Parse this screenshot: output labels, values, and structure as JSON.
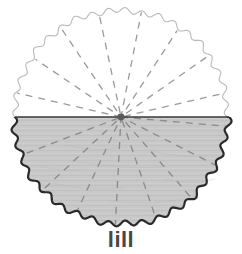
{
  "figure": {
    "name": "scalloped-circle-radial-diagram",
    "caption": "lill",
    "background_color": "#ffffff",
    "geometry": {
      "center_x": 121,
      "center_y": 117,
      "radius": 107,
      "scallop_count": 40,
      "scallop_amplitude": 2.6
    },
    "upper_half": {
      "label": "unshaded upper half",
      "fill_color": "#ffffff",
      "rim_color": "#b9b9b9",
      "rim_width": 1.1
    },
    "lower_half": {
      "label": "shaded lower half",
      "fill_color": "#c8c8c8",
      "rim_color": "#2a2a2a",
      "rim_width": 2.2
    },
    "diameter_line": {
      "label": "horizontal diameter",
      "color": "#3a3a3a",
      "width": 1.6,
      "y": 117
    },
    "hub": {
      "label": "center hub",
      "color": "#5a5a5a",
      "radius": 3.4
    },
    "spokes": {
      "label": "dashed radial spokes",
      "color": "#9a9a9a",
      "color_shaded": "#8a8a8a",
      "width": 1.3,
      "dash": "7 6",
      "upper_angles_deg": [
        193,
        214,
        236,
        258,
        281,
        303,
        325,
        347
      ],
      "lower_angles_deg": [
        5,
        27,
        49,
        71,
        93,
        115,
        137,
        159
      ],
      "count_upper": 8,
      "count_lower": 8
    },
    "texture": {
      "label": "paper grain texture",
      "color": "#b0b0b0",
      "opacity": 0.33
    }
  }
}
